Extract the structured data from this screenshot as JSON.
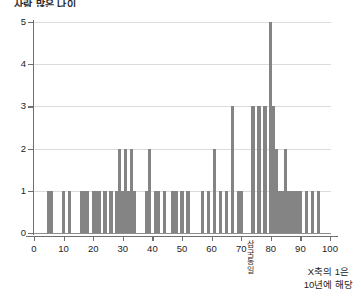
{
  "title_partial": "사람 많은 나이",
  "annotations": {
    "vertical_label": "삼국통일",
    "vertical_chars": [
      "삼",
      "국",
      "통",
      "일"
    ],
    "note_line1": "X축의 1은",
    "note_line2": "10년에 해당"
  },
  "style": {
    "bar_color": "#848484",
    "grid_color": "#dcdcdc",
    "axis_color": "#6f6f6f",
    "background": "#ffffff"
  },
  "chart_data": {
    "type": "bar",
    "title": "사람 많은 나이",
    "xlabel": "X축의 1은 10년에 해당",
    "ylabel": "",
    "xlim": [
      0,
      100
    ],
    "ylim": [
      0,
      5
    ],
    "xticks": [
      0,
      10,
      20,
      30,
      40,
      50,
      60,
      70,
      80,
      90,
      100
    ],
    "yticks": [
      0,
      1,
      2,
      3,
      4,
      5
    ],
    "grid": true,
    "legend": "none",
    "x": [
      5,
      6,
      10,
      12,
      16,
      17,
      18,
      20,
      21,
      22,
      24,
      26,
      28,
      29,
      30,
      31,
      32,
      33,
      34,
      38,
      39,
      41,
      42,
      44,
      47,
      48,
      50,
      52,
      57,
      59,
      61,
      63,
      65,
      67,
      69,
      70,
      74,
      76,
      78,
      80,
      81,
      82,
      83,
      84,
      85,
      86,
      87,
      88,
      89,
      90,
      92,
      94,
      96
    ],
    "values": [
      1,
      1,
      1,
      1,
      1,
      1,
      1,
      1,
      1,
      1,
      1,
      1,
      1,
      2,
      1,
      2,
      1,
      2,
      1,
      1,
      2,
      1,
      1,
      1,
      1,
      1,
      1,
      1,
      1,
      1,
      2,
      1,
      1,
      3,
      1,
      1,
      3,
      3,
      3,
      5,
      3,
      2,
      1,
      1,
      2,
      1,
      1,
      1,
      1,
      1,
      1,
      1,
      1
    ]
  }
}
